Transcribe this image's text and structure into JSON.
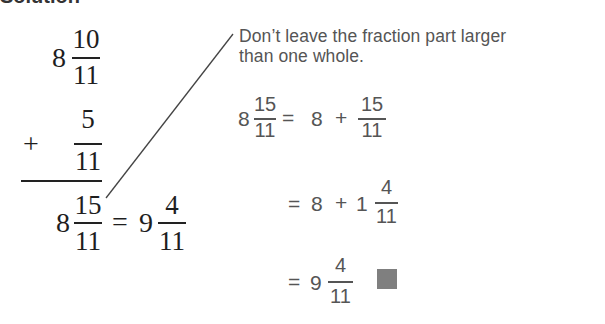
{
  "heading_remnant": "Solution",
  "vertical_addition": {
    "addend1": {
      "whole": "8",
      "numerator": "10",
      "denominator": "11"
    },
    "operator": "+",
    "addend2": {
      "numerator": "5",
      "denominator": "11"
    },
    "result": {
      "whole": "8",
      "numerator": "15",
      "denominator": "11"
    },
    "equals": "=",
    "simplified": {
      "whole": "9",
      "numerator": "4",
      "denominator": "11"
    }
  },
  "note": {
    "line1": "Don’t leave the fraction part larger",
    "line2": "than one whole."
  },
  "steps": [
    {
      "lhs": {
        "whole": "8",
        "numerator": "15",
        "denominator": "11"
      },
      "equals": "=",
      "term1": "8",
      "op": "+",
      "frac": {
        "numerator": "15",
        "denominator": "11"
      }
    },
    {
      "equals": "=",
      "term1": "8",
      "op": "+",
      "mixed": {
        "whole": "1",
        "numerator": "4",
        "denominator": "11"
      }
    },
    {
      "equals": "=",
      "mixed": {
        "whole": "9",
        "numerator": "4",
        "denominator": "11"
      },
      "end_mark": "end-of-solution-square"
    }
  ],
  "colors": {
    "serif_text": "#1e1e1e",
    "sans_text": "#555555",
    "end_mark": "#7f7f7f"
  }
}
